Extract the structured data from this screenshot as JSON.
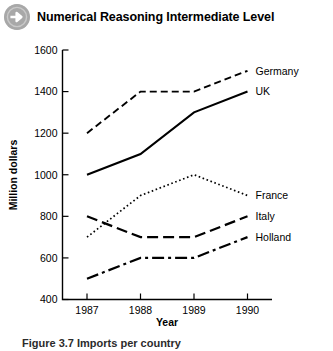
{
  "header": {
    "icon": "arrow-right-circle-icon",
    "title": "Numerical Reasoning Intermediate Level"
  },
  "caption": {
    "text": "Figure 3.7 Imports per country"
  },
  "chart_data": {
    "type": "line",
    "title": "",
    "xlabel": "Year",
    "ylabel": "Million dollars",
    "categories": [
      "1987",
      "1988",
      "1989",
      "1990"
    ],
    "x": [
      1987,
      1988,
      1989,
      1990
    ],
    "ylim": [
      400,
      1600
    ],
    "yticks": [
      400,
      600,
      800,
      1000,
      1200,
      1400,
      1600
    ],
    "grid": false,
    "legend_position": "right-inline-labels",
    "series": [
      {
        "name": "Germany",
        "values": [
          1200,
          1400,
          1400,
          1500
        ],
        "style": "dashed",
        "dasharray": "7,4",
        "width": 1.9
      },
      {
        "name": "UK",
        "values": [
          1000,
          1100,
          1300,
          1400
        ],
        "style": "solid",
        "dasharray": "",
        "width": 2.1
      },
      {
        "name": "France",
        "values": [
          700,
          900,
          1000,
          900
        ],
        "style": "dotted",
        "dasharray": "1.6,2.6",
        "width": 1.7
      },
      {
        "name": "Italy",
        "values": [
          800,
          700,
          700,
          800
        ],
        "style": "longdash",
        "dasharray": "11,5",
        "width": 2.2
      },
      {
        "name": "Holland",
        "values": [
          500,
          600,
          600,
          700
        ],
        "style": "dashdot",
        "dasharray": "12,4,3,4",
        "width": 2.2
      }
    ]
  }
}
